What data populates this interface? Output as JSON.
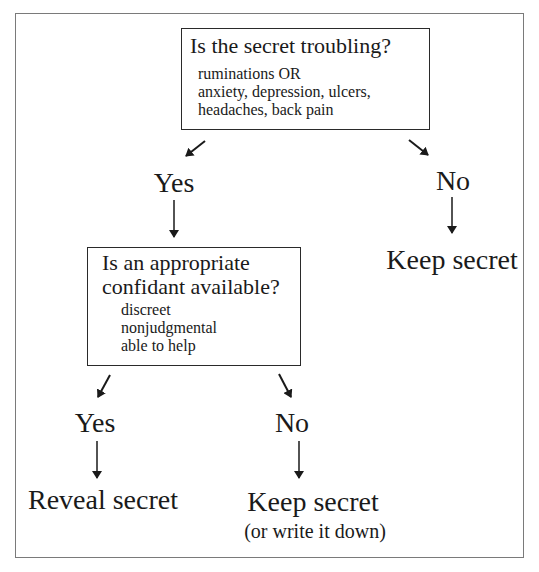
{
  "diagram": {
    "type": "decision-flowchart",
    "root": {
      "question": "Is the secret troubling?",
      "criteria": [
        "ruminations OR",
        "anxiety, depression, ulcers,",
        "headaches, back pain"
      ]
    },
    "root_yes": {
      "label": "Yes"
    },
    "root_no": {
      "label": "No",
      "outcome": "Keep secret"
    },
    "second": {
      "question_line1": "Is an appropriate",
      "question_line2": "confidant available?",
      "criteria": [
        "discreet",
        "nonjudgmental",
        "able to help"
      ]
    },
    "second_yes": {
      "label": "Yes",
      "outcome": "Reveal secret"
    },
    "second_no": {
      "label": "No",
      "outcome": "Keep secret",
      "note": "(or write it down)"
    },
    "edges": [
      {
        "from": "root",
        "to": "root_yes"
      },
      {
        "from": "root",
        "to": "root_no"
      },
      {
        "from": "root_yes",
        "to": "second"
      },
      {
        "from": "root_no",
        "to": "keep_secret_1"
      },
      {
        "from": "second",
        "to": "second_yes"
      },
      {
        "from": "second",
        "to": "second_no"
      },
      {
        "from": "second_yes",
        "to": "reveal_secret"
      },
      {
        "from": "second_no",
        "to": "keep_secret_2"
      }
    ],
    "colors": {
      "ink": "#1a1a1a",
      "frame": "#7a7a7a",
      "background": "#ffffff"
    }
  }
}
